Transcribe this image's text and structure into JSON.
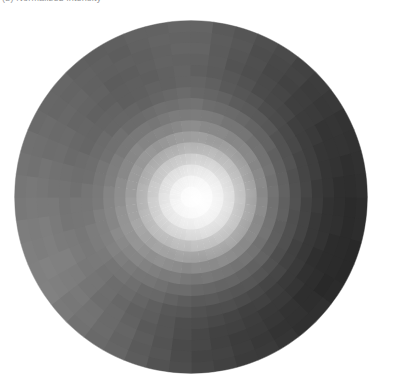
{
  "figure": {
    "name": "polar-radial-heatmap",
    "background_color": "#ffffff",
    "width": 393,
    "height": 390,
    "clipped_caption": "(b) Normalized intensity"
  },
  "chart_data": {
    "type": "heatmap",
    "projection": "polar",
    "title": "",
    "subtitle": "",
    "xlabel": "",
    "ylabel": "",
    "grid": false,
    "legend": null,
    "colormap": "gray",
    "colormap_min_hex": "#3f3f3f",
    "colormap_max_hex": "#ffffff",
    "value_min": 0.0,
    "value_max": 1.0,
    "disc": {
      "center_x": 191,
      "center_y": 197,
      "radius": 177,
      "edge_color": "none"
    },
    "hotspot": {
      "center_x": 198,
      "center_y": 200,
      "peak_value": 1.0,
      "falloff_radius": 150
    },
    "n_theta_bins": 48,
    "n_radial_bins": 16,
    "theta_labels": [],
    "r_tick_labels": [],
    "radial_edges": [
      0.0,
      0.0625,
      0.125,
      0.1875,
      0.25,
      0.3125,
      0.375,
      0.4375,
      0.5,
      0.5625,
      0.625,
      0.6875,
      0.75,
      0.8125,
      0.875,
      0.9375,
      1.0
    ],
    "azimuthal_brightness_deg": [
      {
        "deg": 0,
        "edge_value": 0.19
      },
      {
        "deg": 30,
        "edge_value": 0.17
      },
      {
        "deg": 60,
        "edge_value": 0.22
      },
      {
        "deg": 90,
        "edge_value": 0.28
      },
      {
        "deg": 120,
        "edge_value": 0.4
      },
      {
        "deg": 150,
        "edge_value": 0.5
      },
      {
        "deg": 180,
        "edge_value": 0.46
      },
      {
        "deg": 210,
        "edge_value": 0.4
      },
      {
        "deg": 240,
        "edge_value": 0.36
      },
      {
        "deg": 270,
        "edge_value": 0.4
      },
      {
        "deg": 300,
        "edge_value": 0.3
      },
      {
        "deg": 330,
        "edge_value": 0.22
      }
    ],
    "radial_profile": [
      {
        "r_frac": 0.0,
        "value": 1.0
      },
      {
        "r_frac": 0.06,
        "value": 0.99
      },
      {
        "r_frac": 0.12,
        "value": 0.97
      },
      {
        "r_frac": 0.19,
        "value": 0.94
      },
      {
        "r_frac": 0.25,
        "value": 0.9
      },
      {
        "r_frac": 0.31,
        "value": 0.85
      },
      {
        "r_frac": 0.38,
        "value": 0.79
      },
      {
        "r_frac": 0.44,
        "value": 0.73
      },
      {
        "r_frac": 0.5,
        "value": 0.66
      },
      {
        "r_frac": 0.56,
        "value": 0.6
      },
      {
        "r_frac": 0.63,
        "value": 0.54
      },
      {
        "r_frac": 0.69,
        "value": 0.48
      },
      {
        "r_frac": 0.75,
        "value": 0.43
      },
      {
        "r_frac": 0.81,
        "value": 0.38
      },
      {
        "r_frac": 0.88,
        "value": 0.34
      },
      {
        "r_frac": 0.94,
        "value": 0.31
      },
      {
        "r_frac": 1.0,
        "value": 0.28
      }
    ]
  }
}
